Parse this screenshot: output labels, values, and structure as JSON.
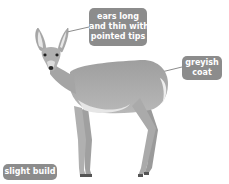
{
  "diagram": {
    "labels": [
      {
        "id": "ears",
        "lines": [
          "ears long",
          "and thin with",
          "pointed tips"
        ]
      },
      {
        "id": "coat",
        "lines": [
          "greyish",
          "coat"
        ]
      },
      {
        "id": "build",
        "lines": [
          "slight build"
        ]
      }
    ],
    "colors": {
      "label_bg": "#8c8c8c",
      "label_text": "#ffffff",
      "animal_fur": "#a8a8a8",
      "animal_belly": "#e6e6e6",
      "leader_line": "#8c8c8c"
    }
  }
}
